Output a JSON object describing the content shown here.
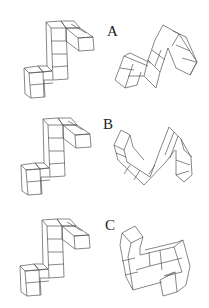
{
  "figure": {
    "rows": [
      {
        "label": "A"
      },
      {
        "label": "B"
      },
      {
        "label": "C"
      }
    ]
  }
}
